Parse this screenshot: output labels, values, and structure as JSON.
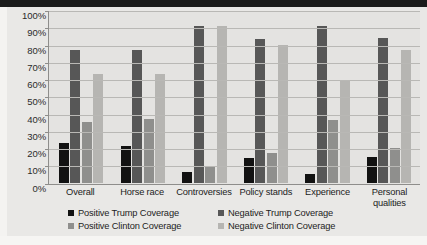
{
  "chart_data": {
    "type": "bar",
    "title": "",
    "xlabel": "",
    "ylabel": "",
    "ylim": [
      0,
      100
    ],
    "ytick_labels": [
      "100%",
      "90%",
      "80%",
      "70%",
      "60%",
      "50%",
      "40%",
      "30%",
      "20%",
      "10%",
      "0%"
    ],
    "ytick_values": [
      100,
      90,
      80,
      70,
      60,
      50,
      40,
      30,
      20,
      10,
      0
    ],
    "grid": true,
    "legend_position": "bottom",
    "categories": [
      "Overall",
      "Horse race",
      "Controversies",
      "Policy stands",
      "Experience",
      "Personal qualities"
    ],
    "series": [
      {
        "name": "Positive Trump Coverage",
        "color": "#121212",
        "values": [
          23,
          21,
          6,
          14,
          5,
          15
        ]
      },
      {
        "name": "Negative Trump Coverage",
        "color": "#575757",
        "values": [
          77,
          77,
          91,
          83,
          91,
          84
        ]
      },
      {
        "name": "Positive Clinton Coverage",
        "color": "#8f8f8d",
        "values": [
          35,
          37,
          9,
          17,
          36,
          20
        ]
      },
      {
        "name": "Negative Clinton Coverage",
        "color": "#b6b5b2",
        "values": [
          63,
          63,
          91,
          80,
          59,
          77
        ]
      }
    ]
  },
  "legend": {
    "items": [
      {
        "label": "Positive Trump Coverage",
        "color": "#121212"
      },
      {
        "label": "Negative Trump Coverage",
        "color": "#575757"
      },
      {
        "label": "Positive Clinton Coverage",
        "color": "#8f8f8d"
      },
      {
        "label": "Negative Clinton Coverage",
        "color": "#b6b5b2"
      }
    ]
  },
  "xaxis": {
    "labels": [
      "Overall",
      "Horse race",
      "Controversies",
      "Policy stands",
      "Experience",
      "Personal qualities"
    ]
  }
}
